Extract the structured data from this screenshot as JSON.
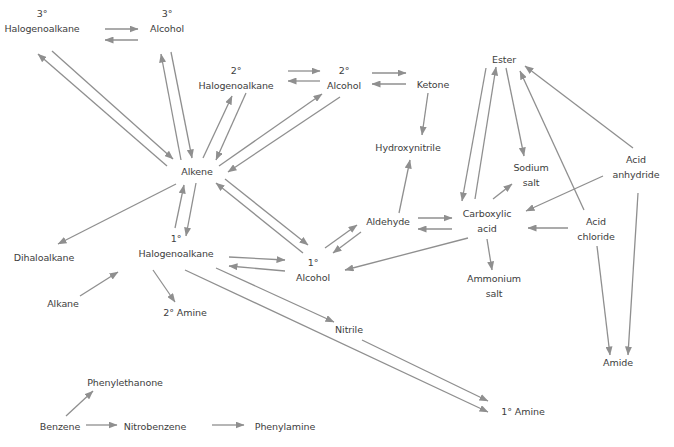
{
  "diagram": {
    "type": "organic-chemistry-reaction-map",
    "arrow_color": "#8f8f8f",
    "text_color": "#3d3d3d",
    "nodes": [
      {
        "id": "halo3",
        "lines": [
          "3°",
          "Halogenoalkane"
        ],
        "x": 42,
        "y": 6
      },
      {
        "id": "alc3",
        "lines": [
          "3°",
          "Alcohol"
        ],
        "x": 167,
        "y": 6
      },
      {
        "id": "halo2",
        "lines": [
          "2°",
          "Halogenoalkane"
        ],
        "x": 236,
        "y": 63
      },
      {
        "id": "alc2",
        "lines": [
          "2°",
          "Alcohol"
        ],
        "x": 344,
        "y": 63
      },
      {
        "id": "ketone",
        "lines": [
          "Ketone"
        ],
        "x": 433,
        "y": 77
      },
      {
        "id": "ester",
        "lines": [
          "Ester"
        ],
        "x": 504,
        "y": 52
      },
      {
        "id": "hydroxynitrile",
        "lines": [
          "Hydroxynitrile"
        ],
        "x": 408,
        "y": 140
      },
      {
        "id": "sodiumsalt",
        "lines": [
          "Sodium",
          "salt"
        ],
        "x": 531,
        "y": 160
      },
      {
        "id": "acidanhydride",
        "lines": [
          "Acid",
          "anhydride"
        ],
        "x": 636,
        "y": 152
      },
      {
        "id": "alkene",
        "lines": [
          "Alkene"
        ],
        "x": 197,
        "y": 164
      },
      {
        "id": "aldehyde",
        "lines": [
          "Aldehyde"
        ],
        "x": 388,
        "y": 214
      },
      {
        "id": "carboxylic",
        "lines": [
          "Carboxylic",
          "acid"
        ],
        "x": 487,
        "y": 206
      },
      {
        "id": "acidchloride",
        "lines": [
          "Acid",
          "chloride"
        ],
        "x": 596,
        "y": 214
      },
      {
        "id": "dihaloalkane",
        "lines": [
          "Dihaloalkane"
        ],
        "x": 44,
        "y": 250
      },
      {
        "id": "halo1",
        "lines": [
          "1°",
          "Halogenoalkane"
        ],
        "x": 176,
        "y": 231
      },
      {
        "id": "alc1",
        "lines": [
          "1°",
          "Alcohol"
        ],
        "x": 313,
        "y": 255
      },
      {
        "id": "ammonium",
        "lines": [
          "Ammonium",
          "salt"
        ],
        "x": 494,
        "y": 271
      },
      {
        "id": "alkane",
        "lines": [
          "Alkane"
        ],
        "x": 63,
        "y": 296
      },
      {
        "id": "amine2",
        "lines": [
          "2° Amine"
        ],
        "x": 185,
        "y": 305
      },
      {
        "id": "nitrile",
        "lines": [
          "Nitrile"
        ],
        "x": 349,
        "y": 322
      },
      {
        "id": "amide",
        "lines": [
          "Amide"
        ],
        "x": 618,
        "y": 355
      },
      {
        "id": "phenylethanone",
        "lines": [
          "Phenylethanone"
        ],
        "x": 125,
        "y": 375
      },
      {
        "id": "amine1",
        "lines": [
          "1° Amine"
        ],
        "x": 523,
        "y": 404
      },
      {
        "id": "benzene",
        "lines": [
          "Benzene"
        ],
        "x": 60,
        "y": 419
      },
      {
        "id": "nitrobenzene",
        "lines": [
          "Nitrobenzene"
        ],
        "x": 155,
        "y": 419
      },
      {
        "id": "phenylamine",
        "lines": [
          "Phenylamine"
        ],
        "x": 285,
        "y": 419
      }
    ],
    "arrows": [
      {
        "from": "halo3",
        "to": "alc3",
        "x1": 105,
        "y1": 29,
        "x2": 138,
        "y2": 29
      },
      {
        "from": "alc3",
        "to": "halo3",
        "x1": 138,
        "y1": 40,
        "x2": 105,
        "y2": 40
      },
      {
        "from": "alkene",
        "to": "halo3",
        "x1": 167,
        "y1": 166,
        "x2": 38,
        "y2": 54
      },
      {
        "from": "halo3",
        "to": "alkene",
        "x1": 52,
        "y1": 51,
        "x2": 173,
        "y2": 159
      },
      {
        "from": "alkene",
        "to": "alc3",
        "x1": 181,
        "y1": 160,
        "x2": 161,
        "y2": 54
      },
      {
        "from": "alc3",
        "to": "alkene",
        "x1": 171,
        "y1": 52,
        "x2": 192,
        "y2": 158
      },
      {
        "from": "alkene",
        "to": "halo2",
        "x1": 203,
        "y1": 158,
        "x2": 232,
        "y2": 96
      },
      {
        "from": "halo2",
        "to": "alkene",
        "x1": 246,
        "y1": 93,
        "x2": 216,
        "y2": 160
      },
      {
        "from": "halo2",
        "to": "alc2",
        "x1": 288,
        "y1": 71,
        "x2": 320,
        "y2": 71
      },
      {
        "from": "alc2",
        "to": "halo2",
        "x1": 320,
        "y1": 81,
        "x2": 288,
        "y2": 81
      },
      {
        "from": "alkene",
        "to": "alc2",
        "x1": 219,
        "y1": 166,
        "x2": 322,
        "y2": 94
      },
      {
        "from": "alc2",
        "to": "alkene",
        "x1": 340,
        "y1": 97,
        "x2": 228,
        "y2": 172
      },
      {
        "from": "alc2",
        "to": "ketone",
        "x1": 372,
        "y1": 73,
        "x2": 406,
        "y2": 73
      },
      {
        "from": "ketone",
        "to": "alc2",
        "x1": 406,
        "y1": 84,
        "x2": 372,
        "y2": 84
      },
      {
        "from": "ketone",
        "to": "hydroxynitrile",
        "x1": 428,
        "y1": 93,
        "x2": 422,
        "y2": 135
      },
      {
        "from": "aldehyde",
        "to": "hydroxynitrile",
        "x1": 399,
        "y1": 213,
        "x2": 410,
        "y2": 160
      },
      {
        "from": "carboxylic",
        "to": "ester",
        "x1": 475,
        "y1": 199,
        "x2": 496,
        "y2": 67
      },
      {
        "from": "ester",
        "to": "carboxylic",
        "x1": 486,
        "y1": 68,
        "x2": 462,
        "y2": 201
      },
      {
        "from": "ester",
        "to": "sodiumsalt",
        "x1": 506,
        "y1": 68,
        "x2": 524,
        "y2": 156
      },
      {
        "from": "carboxylic",
        "to": "sodiumsalt",
        "x1": 493,
        "y1": 199,
        "x2": 512,
        "y2": 184
      },
      {
        "from": "acidchloride",
        "to": "ester",
        "x1": 584,
        "y1": 210,
        "x2": 520,
        "y2": 71
      },
      {
        "from": "acidanhydride",
        "to": "ester",
        "x1": 633,
        "y1": 148,
        "x2": 525,
        "y2": 66
      },
      {
        "from": "acidanhydride",
        "to": "carboxylic",
        "x1": 603,
        "y1": 176,
        "x2": 526,
        "y2": 211
      },
      {
        "from": "acidchloride",
        "to": "carboxylic",
        "x1": 568,
        "y1": 228,
        "x2": 528,
        "y2": 228
      },
      {
        "from": "aldehyde",
        "to": "carboxylic",
        "x1": 418,
        "y1": 218,
        "x2": 452,
        "y2": 218
      },
      {
        "from": "carboxylic",
        "to": "aldehyde",
        "x1": 452,
        "y1": 229,
        "x2": 418,
        "y2": 229
      },
      {
        "from": "carboxylic",
        "to": "ammonium",
        "x1": 487,
        "y1": 239,
        "x2": 492,
        "y2": 270
      },
      {
        "from": "carboxylic",
        "to": "alc1",
        "x1": 468,
        "y1": 238,
        "x2": 345,
        "y2": 270
      },
      {
        "from": "acidchloride",
        "to": "amide",
        "x1": 597,
        "y1": 246,
        "x2": 610,
        "y2": 355
      },
      {
        "from": "acidanhydride",
        "to": "amide",
        "x1": 638,
        "y1": 193,
        "x2": 628,
        "y2": 355
      },
      {
        "from": "alkene",
        "to": "dihaloalkane",
        "x1": 176,
        "y1": 184,
        "x2": 58,
        "y2": 244
      },
      {
        "from": "halo1",
        "to": "alkene",
        "x1": 175,
        "y1": 228,
        "x2": 184,
        "y2": 185
      },
      {
        "from": "alkene",
        "to": "halo1",
        "x1": 196,
        "y1": 183,
        "x2": 186,
        "y2": 236
      },
      {
        "from": "alkene",
        "to": "alc1",
        "x1": 225,
        "y1": 179,
        "x2": 308,
        "y2": 245
      },
      {
        "from": "alc1",
        "to": "alkene",
        "x1": 303,
        "y1": 253,
        "x2": 216,
        "y2": 183
      },
      {
        "from": "alc1",
        "to": "aldehyde",
        "x1": 325,
        "y1": 248,
        "x2": 357,
        "y2": 225
      },
      {
        "from": "aldehyde",
        "to": "alc1",
        "x1": 361,
        "y1": 232,
        "x2": 333,
        "y2": 253
      },
      {
        "from": "halo1",
        "to": "alc1",
        "x1": 229,
        "y1": 257,
        "x2": 285,
        "y2": 260
      },
      {
        "from": "alc1",
        "to": "halo1",
        "x1": 285,
        "y1": 271,
        "x2": 229,
        "y2": 266
      },
      {
        "from": "alkane",
        "to": "halo1",
        "x1": 80,
        "y1": 296,
        "x2": 118,
        "y2": 272
      },
      {
        "from": "halo1",
        "to": "amine2",
        "x1": 153,
        "y1": 270,
        "x2": 175,
        "y2": 302
      },
      {
        "from": "halo1",
        "to": "nitrile",
        "x1": 216,
        "y1": 268,
        "x2": 334,
        "y2": 322
      },
      {
        "from": "halo1",
        "to": "amine1",
        "x1": 185,
        "y1": 270,
        "x2": 488,
        "y2": 412
      },
      {
        "from": "nitrile",
        "to": "amine1",
        "x1": 362,
        "y1": 340,
        "x2": 488,
        "y2": 401
      },
      {
        "from": "benzene",
        "to": "phenylethanone",
        "x1": 66,
        "y1": 416,
        "x2": 93,
        "y2": 391
      },
      {
        "from": "benzene",
        "to": "nitrobenzene",
        "x1": 86,
        "y1": 425,
        "x2": 117,
        "y2": 425
      },
      {
        "from": "nitrobenzene",
        "to": "phenylamine",
        "x1": 212,
        "y1": 425,
        "x2": 244,
        "y2": 425
      }
    ]
  }
}
